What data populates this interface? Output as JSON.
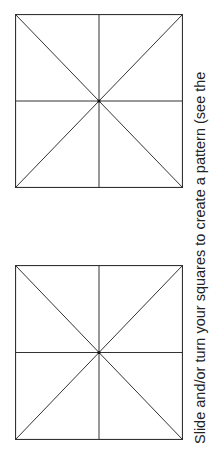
{
  "page": {
    "instruction": "Slide and/or turn your squares to create a pattern (see the",
    "line_color": "#333333"
  },
  "squares": [
    {
      "id": "top",
      "left": 15,
      "top": 14,
      "size": 167
    },
    {
      "id": "bottom",
      "left": 15,
      "top": 265,
      "size": 174
    }
  ]
}
